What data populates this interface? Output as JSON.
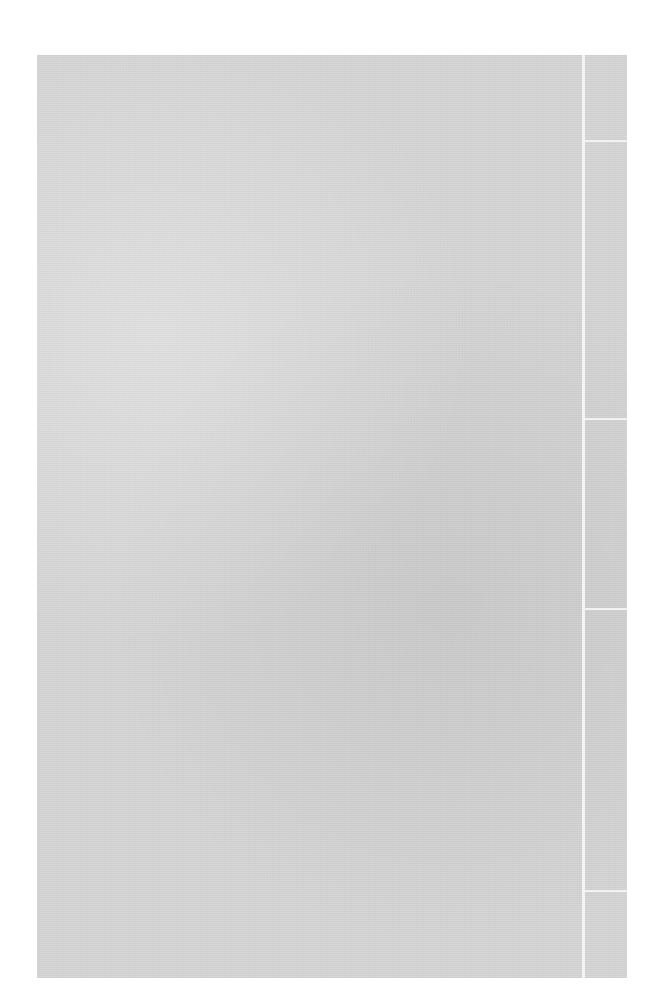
{
  "document": {
    "type": "scanned blank paper sheet",
    "text": "",
    "right_column_dividers_y": [
      140,
      418,
      608,
      890
    ]
  }
}
